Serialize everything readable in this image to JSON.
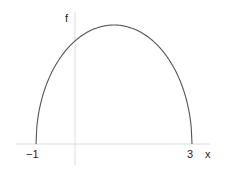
{
  "chart_data": {
    "type": "line",
    "title": "",
    "xlabel": "x",
    "ylabel": "f",
    "x_ticks": [
      -1,
      3
    ],
    "x_tick_labels": [
      "−1",
      "3"
    ],
    "xlim": [
      -1.9,
      3.5
    ],
    "ylim": [
      -0.45,
      2.4
    ],
    "grid": false,
    "series": [
      {
        "name": "f",
        "description": "f(x) = sqrt((x+1)(3-x)), zero at x=-1 and x=3, maximum 2 at x=1",
        "x": [
          -1,
          -0.9,
          -0.75,
          -0.5,
          -0.25,
          0,
          0.25,
          0.5,
          0.75,
          1,
          1.25,
          1.5,
          1.75,
          2,
          2.25,
          2.5,
          2.75,
          2.9,
          3
        ],
        "y": [
          0,
          0.62,
          0.97,
          1.32,
          1.56,
          1.73,
          1.85,
          1.94,
          1.98,
          2.0,
          1.98,
          1.94,
          1.85,
          1.73,
          1.56,
          1.32,
          0.97,
          0.62,
          0
        ]
      }
    ],
    "colors": {
      "curve": "#555555",
      "axes": "#d8d8d8",
      "text": "#222222"
    }
  },
  "labels": {
    "x_axis": "x",
    "y_axis": "f",
    "tick_left": "−1",
    "tick_right": "3"
  }
}
